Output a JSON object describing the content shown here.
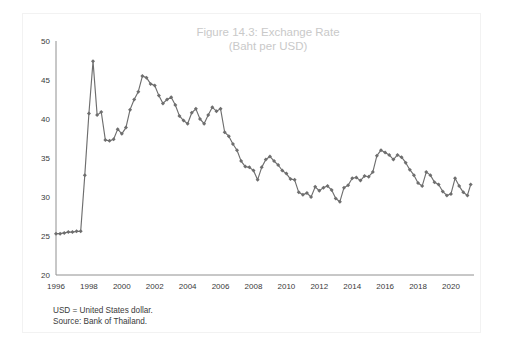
{
  "figure": {
    "title_line1": "Figure 14.3: Exchange Rate",
    "title_line2": "(Baht per USD)",
    "border_color": "#f2f2f2",
    "background": "#ffffff"
  },
  "footnotes": [
    "USD = United States dollar.",
    "Source: Bank of Thailand."
  ],
  "chart_data": {
    "type": "line",
    "title": "Figure 14.3: Exchange Rate (Baht per USD)",
    "xlabel": "",
    "ylabel": "",
    "xlim": [
      1996,
      2021.4
    ],
    "ylim": [
      20,
      50
    ],
    "yticks": [
      20,
      25,
      30,
      35,
      40,
      45,
      50
    ],
    "xticks": [
      1996,
      1998,
      2000,
      2002,
      2004,
      2006,
      2008,
      2010,
      2012,
      2014,
      2016,
      2018,
      2020
    ],
    "grid": false,
    "legend": null,
    "line_color": "#6e6e6e",
    "marker": "diamond",
    "marker_color": "#6e6e6e",
    "series": [
      {
        "name": "Baht per USD",
        "x": [
          1996.0,
          1996.25,
          1996.5,
          1996.75,
          1997.0,
          1997.25,
          1997.5,
          1997.75,
          1998.0,
          1998.25,
          1998.5,
          1998.75,
          1999.0,
          1999.25,
          1999.5,
          1999.75,
          2000.0,
          2000.25,
          2000.5,
          2000.75,
          2001.0,
          2001.25,
          2001.5,
          2001.75,
          2002.0,
          2002.25,
          2002.5,
          2002.75,
          2003.0,
          2003.25,
          2003.5,
          2003.75,
          2004.0,
          2004.25,
          2004.5,
          2004.75,
          2005.0,
          2005.25,
          2005.5,
          2005.75,
          2006.0,
          2006.25,
          2006.5,
          2006.75,
          2007.0,
          2007.25,
          2007.5,
          2007.75,
          2008.0,
          2008.25,
          2008.5,
          2008.75,
          2009.0,
          2009.25,
          2009.5,
          2009.75,
          2010.0,
          2010.25,
          2010.5,
          2010.75,
          2011.0,
          2011.25,
          2011.5,
          2011.75,
          2012.0,
          2012.25,
          2012.5,
          2012.75,
          2013.0,
          2013.25,
          2013.5,
          2013.75,
          2014.0,
          2014.25,
          2014.5,
          2014.75,
          2015.0,
          2015.25,
          2015.5,
          2015.75,
          2016.0,
          2016.25,
          2016.5,
          2016.75,
          2017.0,
          2017.25,
          2017.5,
          2017.75,
          2018.0,
          2018.25,
          2018.5,
          2018.75,
          2019.0,
          2019.25,
          2019.5,
          2019.75,
          2020.0,
          2020.25,
          2020.5,
          2020.75,
          2021.0,
          2021.2
        ],
        "values": [
          25.3,
          25.3,
          25.4,
          25.5,
          25.5,
          25.6,
          25.6,
          32.8,
          40.7,
          47.4,
          40.5,
          40.9,
          37.3,
          37.2,
          37.4,
          38.7,
          38.1,
          38.9,
          41.2,
          42.5,
          43.5,
          45.5,
          45.3,
          44.5,
          44.3,
          43.0,
          42.0,
          42.5,
          42.8,
          41.8,
          40.4,
          39.8,
          39.4,
          40.8,
          41.3,
          40.0,
          39.4,
          40.5,
          41.5,
          41.0,
          41.3,
          38.3,
          37.8,
          36.8,
          36.0,
          34.6,
          33.9,
          33.8,
          33.4,
          32.2,
          33.8,
          34.8,
          35.2,
          34.6,
          34.1,
          33.4,
          33.0,
          32.3,
          32.2,
          30.6,
          30.3,
          30.5,
          30.0,
          31.3,
          30.8,
          31.2,
          31.4,
          30.9,
          29.8,
          29.4,
          31.2,
          31.5,
          32.4,
          32.5,
          32.1,
          32.7,
          32.6,
          33.2,
          35.3,
          36.0,
          35.7,
          35.4,
          34.8,
          35.4,
          35.1,
          34.4,
          33.5,
          32.8,
          31.8,
          31.4,
          33.2,
          32.8,
          31.9,
          31.6,
          30.7,
          30.2,
          30.4,
          32.4,
          31.4,
          30.6,
          30.2,
          31.6
        ]
      }
    ]
  }
}
